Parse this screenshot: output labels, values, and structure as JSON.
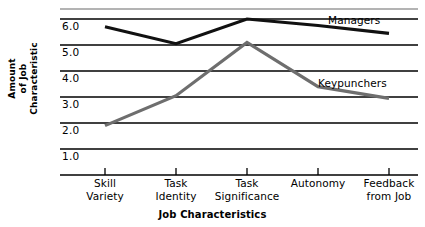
{
  "chart_data": {
    "type": "line",
    "title": "",
    "xlabel": "Job Characteristics",
    "ylabel": "Amount of Job Characteristic",
    "ylabel_lines": [
      "Amount",
      "of Job",
      "Characteristic"
    ],
    "categories": [
      "Skill Variety",
      "Task Identity",
      "Task Significance",
      "Autonomy",
      "Feedback from Job"
    ],
    "category_lines": [
      [
        "Skill",
        "Variety"
      ],
      [
        "Task",
        "Identity"
      ],
      [
        "Task",
        "Significance"
      ],
      [
        "Autonomy",
        ""
      ],
      [
        "Feedback",
        "from Job"
      ]
    ],
    "ylim": [
      0.5,
      6.5
    ],
    "yticks": [
      6.0,
      5.0,
      4.0,
      3.0,
      2.0,
      1.0
    ],
    "ytick_labels": [
      "6.0",
      "5.0",
      "4.0",
      "3.0",
      "2.0",
      "1.0"
    ],
    "grid": true,
    "gridline_values": [
      6.5,
      6.0,
      5.0,
      4.0,
      3.0,
      2.0,
      1.0,
      0.5
    ],
    "legend_position": "inline-right",
    "series": [
      {
        "name": "Managers",
        "color": "#111111",
        "values": [
          5.7,
          5.05,
          6.0,
          5.75,
          5.45
        ],
        "label_text": "Managers"
      },
      {
        "name": "Keypunchers",
        "color": "#6e6e6e",
        "values": [
          1.9,
          3.05,
          5.1,
          3.4,
          2.95
        ],
        "label_text": "Keypunchers"
      }
    ]
  },
  "colors": {
    "managers_line": "#111111",
    "keypunchers_line": "#6e6e6e",
    "gridline": "#000000",
    "top_gridline": "#9a9a9a",
    "background": "#ffffff",
    "text": "#000000"
  }
}
